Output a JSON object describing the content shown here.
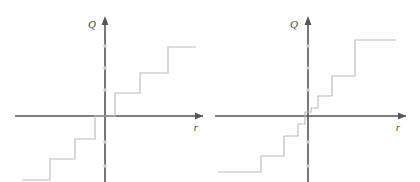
{
  "figure": {
    "background_color": "#ffffff",
    "axis_color": "#555555",
    "curve_color": "#bcbcbc",
    "tick_color": "#c9c9c9",
    "panel_count": 2
  },
  "panels": [
    {
      "id": "left",
      "name": "uniform-staircase",
      "xlabel": "r",
      "ylabel": "Q",
      "origin": {
        "x": 105,
        "y": 116
      },
      "x_axis": {
        "start": 15,
        "end": 203,
        "y": 116
      },
      "y_axis": {
        "x": 105,
        "top": 18,
        "bottom": 182
      },
      "xlabel_pos": {
        "x": 196,
        "y": 131
      },
      "ylabel_pos": {
        "x": 92,
        "y": 28
      },
      "tick_dots_y": [
        46,
        68,
        90,
        142,
        166
      ],
      "steps": [
        {
          "riser_x": 115,
          "tread_y": 93,
          "tread_end": 140
        },
        {
          "riser_x": 140,
          "tread_y": 73,
          "tread_end": 168
        },
        {
          "riser_x": 168,
          "tread_y": 47,
          "tread_end": 196
        },
        {
          "riser_x": 95,
          "tread_y": 139,
          "tread_end": 75
        },
        {
          "riser_x": 75,
          "tread_y": 159,
          "tread_end": 50
        },
        {
          "riser_x": 50,
          "tread_y": 180,
          "tread_end": 22
        }
      ]
    },
    {
      "id": "right",
      "name": "geometric-staircase",
      "xlabel": "r",
      "ylabel": "Q",
      "origin": {
        "x": 98,
        "y": 116
      },
      "x_axis": {
        "start": 5,
        "end": 196,
        "y": 116
      },
      "y_axis": {
        "x": 98,
        "top": 18,
        "bottom": 182
      },
      "xlabel_pos": {
        "x": 188,
        "y": 131
      },
      "ylabel_pos": {
        "x": 84,
        "y": 28
      },
      "tick_dots_y": [
        46,
        68,
        90,
        142,
        166
      ],
      "steps": [
        {
          "riser_x": 101,
          "tread_y": 108,
          "tread_end": 108
        },
        {
          "riser_x": 108,
          "tread_y": 96,
          "tread_end": 122
        },
        {
          "riser_x": 122,
          "tread_y": 76,
          "tread_end": 145
        },
        {
          "riser_x": 145,
          "tread_y": 40,
          "tread_end": 186
        },
        {
          "riser_x": 95,
          "tread_y": 124,
          "tread_end": 88
        },
        {
          "riser_x": 88,
          "tread_y": 136,
          "tread_end": 74
        },
        {
          "riser_x": 74,
          "tread_y": 156,
          "tread_end": 51
        },
        {
          "riser_x": 51,
          "tread_y": 172,
          "tread_end": 8
        }
      ]
    }
  ],
  "chart_data": {
    "type": "line",
    "title": "",
    "xlabel": "r",
    "ylabel": "Q",
    "grid": false,
    "legend": null,
    "charts": [
      {
        "name": "uniform-staircase",
        "type": "line",
        "step_style": "step-post",
        "xlabel": "r",
        "ylabel": "Q",
        "xlim": [
          -4,
          4
        ],
        "ylim": [
          -4,
          4
        ],
        "comment": "Equally spaced risers: charge increments at regular radii.",
        "x": [
          -3.5,
          -3.0,
          -3.0,
          -2.0,
          -2.0,
          -1.0,
          -1.0,
          0.0,
          0.0,
          0.5,
          0.5,
          1.5,
          1.5,
          2.5,
          2.5,
          3.5
        ],
        "y": [
          -3.0,
          -3.0,
          -2.0,
          -2.0,
          -1.0,
          -1.0,
          0.0,
          0.0,
          0.0,
          0.0,
          1.0,
          1.0,
          2.0,
          2.0,
          3.0,
          3.0
        ],
        "steps_positive": [
          {
            "r": 0.5,
            "Q": 1
          },
          {
            "r": 1.5,
            "Q": 2
          },
          {
            "r": 2.5,
            "Q": 3
          }
        ],
        "steps_negative": [
          {
            "r": -0.5,
            "Q": -1
          },
          {
            "r": -1.5,
            "Q": -2
          },
          {
            "r": -2.5,
            "Q": -3
          }
        ]
      },
      {
        "name": "geometric-staircase",
        "type": "line",
        "step_style": "step-post",
        "xlabel": "r",
        "ylabel": "Q",
        "xlim": [
          -4,
          4
        ],
        "ylim": [
          -4,
          4
        ],
        "comment": "Geometrically spaced risers: steps crowd near the origin and widen outward.",
        "x": [
          -3.8,
          -2.0,
          -2.0,
          -1.0,
          -1.0,
          -0.5,
          -0.5,
          -0.15,
          -0.15,
          0.0,
          0.0,
          0.15,
          0.15,
          0.5,
          0.5,
          1.0,
          1.0,
          2.0,
          2.0,
          3.8
        ],
        "y": [
          -4.0,
          -4.0,
          -3.0,
          -3.0,
          -2.0,
          -2.0,
          -1.0,
          -1.0,
          -0.4,
          -0.4,
          0.4,
          0.4,
          1.0,
          1.0,
          2.0,
          2.0,
          3.0,
          3.0,
          4.0,
          4.0
        ],
        "steps_positive": [
          {
            "r": 0.15,
            "Q": 1
          },
          {
            "r": 0.5,
            "Q": 2
          },
          {
            "r": 1.0,
            "Q": 3
          },
          {
            "r": 2.0,
            "Q": 4
          }
        ],
        "steps_negative": [
          {
            "r": -0.15,
            "Q": -1
          },
          {
            "r": -0.5,
            "Q": -2
          },
          {
            "r": -1.0,
            "Q": -3
          },
          {
            "r": -2.0,
            "Q": -4
          }
        ]
      }
    ]
  }
}
